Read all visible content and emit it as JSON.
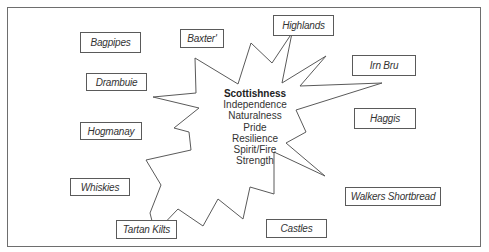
{
  "diagram": {
    "type": "starburst-mind-map",
    "center": {
      "title": "Scottishness",
      "attributes": [
        "Independence",
        "Naturalness",
        "Pride",
        "Resilience",
        "Spirit/Fire",
        "Strength"
      ]
    },
    "boxes": [
      {
        "label": "Bagpipes",
        "x": 80,
        "y": 32,
        "w": 61,
        "h": 21
      },
      {
        "label": "Baxter'",
        "x": 180,
        "y": 29,
        "w": 44,
        "h": 19
      },
      {
        "label": "Highlands",
        "x": 273,
        "y": 15,
        "w": 61,
        "h": 21
      },
      {
        "label": "Drambuie",
        "x": 86,
        "y": 73,
        "w": 61,
        "h": 18
      },
      {
        "label": "Irn Bru",
        "x": 352,
        "y": 55,
        "w": 64,
        "h": 21
      },
      {
        "label": "Hogmanay",
        "x": 80,
        "y": 122,
        "w": 62,
        "h": 18
      },
      {
        "label": "Haggis",
        "x": 354,
        "y": 108,
        "w": 62,
        "h": 21
      },
      {
        "label": "Whiskies",
        "x": 70,
        "y": 178,
        "w": 60,
        "h": 18
      },
      {
        "label": "Walkers Shortbread",
        "x": 345,
        "y": 187,
        "w": 96,
        "h": 19
      },
      {
        "label": "Tartan Kilts",
        "x": 116,
        "y": 220,
        "w": 61,
        "h": 19
      },
      {
        "label": "Castles",
        "x": 266,
        "y": 219,
        "w": 61,
        "h": 19
      }
    ],
    "colors": {
      "stroke": "#5a5a5a",
      "text": "#333333",
      "background": "#ffffff"
    }
  }
}
